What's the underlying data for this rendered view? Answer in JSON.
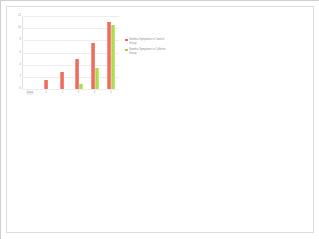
{
  "chart_data": {
    "type": "bar",
    "title": "",
    "subtitle": "",
    "xlabel": "",
    "ylabel": "",
    "grid": true,
    "legend_position": "right",
    "categories": [
      "Dose",
      "1",
      "2",
      "3",
      "4",
      "5"
    ],
    "ylim": [
      0,
      12
    ],
    "yticks": [
      0,
      2,
      4,
      6,
      8,
      10,
      12
    ],
    "ytick_labels": [
      "0",
      "2",
      "4",
      "6",
      "8",
      "10",
      "12"
    ],
    "series": [
      {
        "name": "Gambia Symptoms in Control Group",
        "color": "#ef5f52",
        "values": [
          0,
          1.5,
          2.8,
          5.0,
          7.5,
          11.0
        ]
      },
      {
        "name": "Gambia Symptoms in Caffeine Group",
        "color": "#9ed93a",
        "values": [
          0,
          0,
          0,
          0.8,
          3.5,
          10.5
        ]
      }
    ]
  },
  "legend": {
    "entries": [
      {
        "label": "Gambia Symptoms in Control Group",
        "swatch": "#ef5f52"
      },
      {
        "label": "Gambia Symptoms in Caffeine Group",
        "swatch": "#9ed93a"
      }
    ]
  }
}
